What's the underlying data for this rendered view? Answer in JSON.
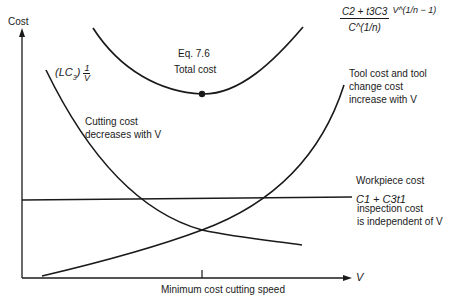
{
  "diagram": {
    "axes": {
      "y_label": "Cost",
      "x_label": "V",
      "x_marker_label": "Minimum cost cutting speed"
    },
    "curves": {
      "total_cost": {
        "eq_ref": "Eq. 7.6",
        "label": "Total cost",
        "formula_numerator": "C2 + t3C3",
        "formula_power": "V^(1/n − 1)",
        "formula_denominator": "C^(1/n)"
      },
      "cutting_cost": {
        "formula": "(LC3) 1/V",
        "formula_prefix": "(LC",
        "formula_sub": "3",
        "formula_suffix": ")",
        "frac_num": "1",
        "frac_den": "V",
        "label_line1": "Cutting cost",
        "label_line2": "decreases with V"
      },
      "tool_cost": {
        "label_line1": "Tool cost and tool",
        "label_line2": "change cost",
        "label_line3": "increase with V"
      },
      "workpiece_cost": {
        "formula": "C1 + C3t1",
        "label_line1": "Workpiece cost",
        "label_line2": "loading and",
        "label_line3": "inspection cost",
        "label_line4": "is independent of V"
      }
    },
    "colors": {
      "line": "#1a1a1a",
      "background": "#ffffff"
    }
  }
}
